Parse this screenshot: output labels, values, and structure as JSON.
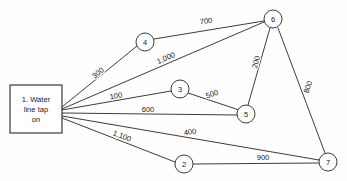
{
  "diagram": {
    "background_color": "#fefefe",
    "line_color": "#262626",
    "canvas": {
      "width": 347,
      "height": 181
    }
  },
  "source_node": {
    "name": "water-line-tap-box",
    "lines": [
      "1.  Water",
      "line tap",
      "on"
    ],
    "label": "1. Water line tap on",
    "x": 10,
    "y": 85,
    "width": 52,
    "height": 48
  },
  "nodes": [
    {
      "id": "2",
      "label": "2",
      "x": 184,
      "y": 164,
      "r": 9
    },
    {
      "id": "3",
      "label": "3",
      "x": 180,
      "y": 89,
      "r": 9
    },
    {
      "id": "4",
      "label": "4",
      "x": 145,
      "y": 42,
      "r": 9
    },
    {
      "id": "5",
      "label": "5",
      "x": 246,
      "y": 114,
      "r": 9
    },
    {
      "id": "6",
      "label": "6",
      "x": 273,
      "y": 19,
      "r": 9
    },
    {
      "id": "7",
      "label": "7",
      "x": 328,
      "y": 162,
      "r": 9
    }
  ],
  "edges": [
    {
      "name": "edge-box-4",
      "from": "1",
      "to": "4",
      "weight": "300",
      "x1": 62,
      "y1": 107,
      "x2": 137,
      "y2": 46,
      "lx": 98,
      "ly": 73,
      "rot": -39
    },
    {
      "name": "edge-4-6",
      "from": "4",
      "to": "6",
      "weight": "700",
      "x1": 154,
      "y1": 39,
      "x2": 264,
      "y2": 21,
      "lx": 206,
      "ly": 21,
      "rot": -6
    },
    {
      "name": "edge-box-6",
      "from": "1",
      "to": "6",
      "weight": "1,000",
      "x1": 62,
      "y1": 109,
      "x2": 264,
      "y2": 22,
      "lx": 166,
      "ly": 58,
      "rot": -24
    },
    {
      "name": "edge-box-3",
      "from": "1",
      "to": "3",
      "weight": "100",
      "x1": 62,
      "y1": 110,
      "x2": 171,
      "y2": 91,
      "lx": 116,
      "ly": 96,
      "rot": -10
    },
    {
      "name": "edge-3-5",
      "from": "3",
      "to": "5",
      "weight": "500",
      "x1": 188,
      "y1": 93,
      "x2": 239,
      "y2": 110,
      "lx": 212,
      "ly": 94,
      "rot": -19
    },
    {
      "name": "edge-box-5",
      "from": "1",
      "to": "5",
      "weight": "600",
      "x1": 62,
      "y1": 113,
      "x2": 237,
      "y2": 115,
      "lx": 148,
      "ly": 109,
      "rot": 0
    },
    {
      "name": "edge-5-6",
      "from": "5",
      "to": "6",
      "weight": "200",
      "x1": 248,
      "y1": 105,
      "x2": 270,
      "y2": 28,
      "lx": 256,
      "ly": 62,
      "rot": -74
    },
    {
      "name": "edge-6-7",
      "from": "6",
      "to": "7",
      "weight": "800",
      "x1": 278,
      "y1": 28,
      "x2": 325,
      "y2": 153,
      "lx": 308,
      "ly": 87,
      "rot": -70
    },
    {
      "name": "edge-box-7",
      "from": "1",
      "to": "7",
      "weight": "400",
      "x1": 62,
      "y1": 116,
      "x2": 319,
      "y2": 160,
      "lx": 190,
      "ly": 132,
      "rot": -9
    },
    {
      "name": "edge-box-2",
      "from": "1",
      "to": "2",
      "weight": "1,100",
      "x1": 62,
      "y1": 118,
      "x2": 175,
      "y2": 162,
      "lx": 122,
      "ly": 136,
      "rot": 21
    },
    {
      "name": "edge-2-7",
      "from": "2",
      "to": "7",
      "weight": "900",
      "x1": 193,
      "y1": 164,
      "x2": 319,
      "y2": 163,
      "lx": 263,
      "ly": 157,
      "rot": 0
    }
  ]
}
